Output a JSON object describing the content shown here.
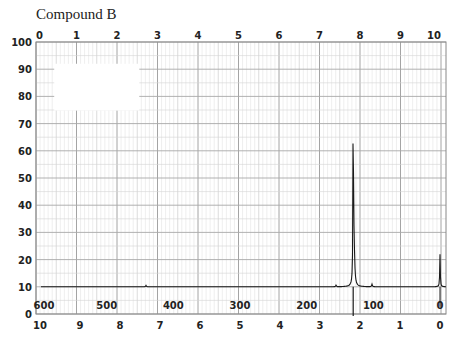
{
  "title": "Compound B",
  "chart_data": {
    "type": "line",
    "title": "Compound B",
    "xlabel": "",
    "ylabel": "",
    "chart_kind": "1H NMR spectrum",
    "y_ticks": [
      0,
      10,
      20,
      30,
      40,
      50,
      60,
      70,
      80,
      90,
      100
    ],
    "ylim": [
      0,
      100
    ],
    "top_axis_ticks": [
      "0",
      "1",
      "2",
      "3",
      "4",
      "5",
      "6",
      "7",
      "8",
      "9",
      "10"
    ],
    "bottom_ppm_ticks": [
      "10",
      "9",
      "8",
      "7",
      "6",
      "5",
      "4",
      "3",
      "2",
      "1",
      "0"
    ],
    "hz_ticks": [
      "600",
      "500",
      "400",
      "300",
      "200",
      "100",
      "0"
    ],
    "xlim_ppm": [
      10,
      0
    ],
    "baseline": 10,
    "peaks": [
      {
        "ppm": 7.35,
        "height": 10.5,
        "note": "tiny artifact"
      },
      {
        "ppm": 2.6,
        "height": 10.6,
        "note": "tiny"
      },
      {
        "ppm": 2.17,
        "height": 90,
        "note": "main singlet"
      },
      {
        "ppm": 2.15,
        "height": 26,
        "note": "shoulder"
      },
      {
        "ppm": 1.7,
        "height": 11,
        "note": "small"
      },
      {
        "ppm": 0.0,
        "height": 22,
        "note": "TMS reference"
      }
    ],
    "grid": true,
    "legend": null,
    "masked_region": {
      "x_units": [
        0.45,
        2.55
      ],
      "y_units": [
        77,
        92
      ]
    }
  }
}
